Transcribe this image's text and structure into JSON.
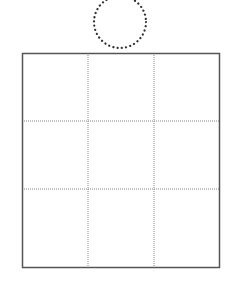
{
  "diagram": {
    "canvas": {
      "width": 231,
      "height": 283,
      "background": "#ffffff"
    },
    "circle": {
      "cx": 120,
      "cy": 22,
      "r": 26,
      "style": "dotted",
      "color": "#333333"
    },
    "grid": {
      "x": 22,
      "y": 53,
      "width": 198,
      "height": 215,
      "rows": 3,
      "cols": 3,
      "border_color": "#555555",
      "inner_line_color": "#888888",
      "inner_line_style": "dotted",
      "col_dividers_x": [
        88,
        154
      ],
      "row_dividers_y": [
        121,
        189
      ]
    }
  }
}
